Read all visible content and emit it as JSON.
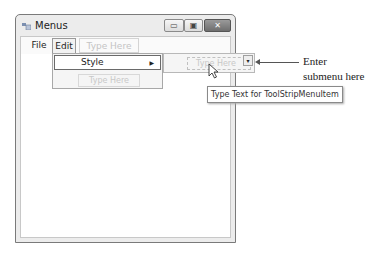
{
  "window": {
    "title": "Menus",
    "controls": {
      "minimize": "▭",
      "maximize": "▣",
      "close": "✕"
    }
  },
  "menubar": {
    "items": [
      {
        "label": "File",
        "mnemonic": "F"
      },
      {
        "label": "Edit",
        "mnemonic": "E",
        "state": "open"
      },
      {
        "label": "Type Here",
        "placeholder": true
      }
    ]
  },
  "edit_menu": {
    "items": [
      {
        "label": "Style",
        "mnemonic": "S",
        "has_submenu": true,
        "submenu_arrow": "▶"
      },
      {
        "label": "Type Here",
        "placeholder": true
      }
    ]
  },
  "style_submenu": {
    "placeholder": "Type Here",
    "dropdown_glyph": "▾"
  },
  "tooltip": {
    "text": "Type Text for ToolStripMenuItem"
  },
  "annotation": {
    "line1": "Enter",
    "line2": "submenu here"
  }
}
